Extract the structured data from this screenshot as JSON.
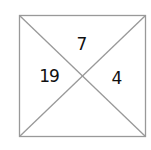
{
  "diagram": {
    "type": "square-divided-by-diagonals",
    "line_color": "#999999",
    "text_color": "#111111",
    "regions": {
      "top": {
        "value": "7"
      },
      "left": {
        "value": "19"
      },
      "right": {
        "value": "4"
      },
      "bottom": {
        "value": ""
      }
    }
  }
}
